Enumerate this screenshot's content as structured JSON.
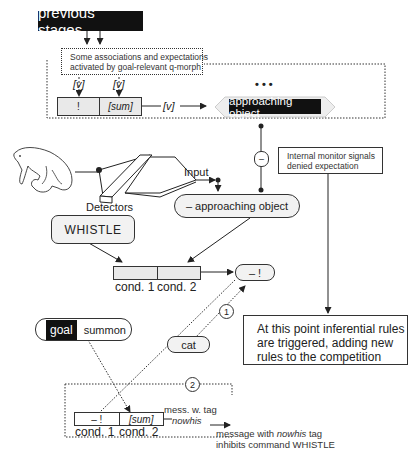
{
  "previous_stages": {
    "label": "previous stages"
  },
  "associations_box": {
    "line1": "Some associations and expectations",
    "line2": "activated by goal-relevant q-morph"
  },
  "top_rule": {
    "var_marker_1": "[v]",
    "var_marker_2": "[v]",
    "cond1": "!",
    "cond2": "[sum]",
    "output_var": "[v]"
  },
  "ellipsis": "• • •",
  "approaching_object": "approaching object",
  "detectors": {
    "label": "Detectors",
    "input_label": "Input"
  },
  "negated_object": "– approaching object",
  "minus_node": "–",
  "monitor_box": {
    "line1": "Internal monitor signals",
    "line2": "denied expectation"
  },
  "whistle": "WHISTLE",
  "middle_rule": {
    "cond1_label": "cond. 1",
    "cond2_label": "cond. 2"
  },
  "neg_bang": "– !",
  "marker_1": "1",
  "marker_2": "2",
  "inferential_box": {
    "line1": "At this point inferential rules",
    "line2": "are triggered, adding new",
    "line3": "rules to the competition"
  },
  "goal_pill": {
    "tag": "goal",
    "value": "summon"
  },
  "cat_pill": "cat",
  "bottom_rule": {
    "cond1": "– !",
    "cond2": "[sum]",
    "cond1_label": "cond. 1",
    "cond2_label": "cond. 2",
    "tag_line1": "mess. w. tag",
    "tag_line2": "nowhis"
  },
  "message_note": {
    "line1_pre": "message with ",
    "line1_em": "nowhis",
    "line1_post": " tag",
    "line2": "inhibits command WHISTLE"
  }
}
